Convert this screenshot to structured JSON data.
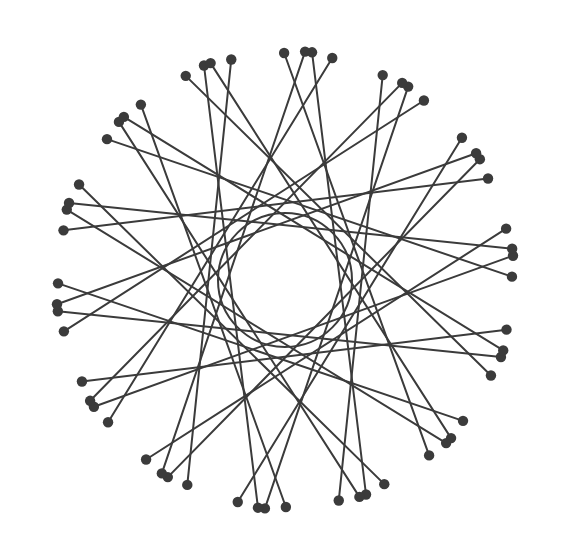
{
  "figure": {
    "type": "geometric-line-figure",
    "background_color": "#ffffff",
    "line_color": "#3b3b3b",
    "dot_color": "#3b3b3b",
    "line_width": 2,
    "dot_radius": 5.2,
    "canvas": {
      "width": 564,
      "height": 560
    }
  },
  "chart_data": {
    "type": "scatter",
    "subtitle": "",
    "xlabel": "",
    "ylabel": "",
    "grid": false,
    "legend": "none",
    "xlim": [
      0,
      564
    ],
    "ylim": [
      0,
      560
    ],
    "geometry": {
      "center_x": 285,
      "center_y": 280,
      "vertex_ring_radius": 198,
      "dot_ring_radius": 232,
      "inner_void_radius": 67,
      "vertex_count": 28,
      "chord_step": 11,
      "extension_ratio": 1.17,
      "start_angle_deg": -84.1,
      "pair_half_gap_deg": 3.1
    }
  }
}
